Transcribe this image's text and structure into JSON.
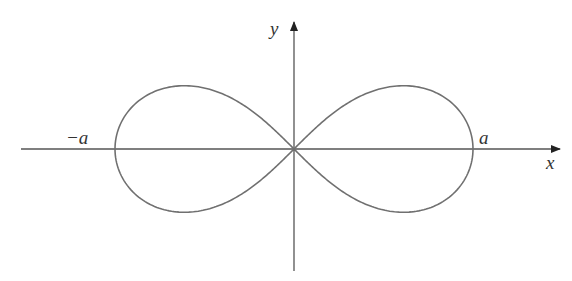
{
  "diagram": {
    "title": "",
    "curve": {
      "name": "lemniscate",
      "color": "#707070",
      "parameter_label": "a"
    },
    "axes": {
      "color": "#555555",
      "x_label": "x",
      "y_label": "y"
    },
    "labels": {
      "neg_a": "−a",
      "pos_a": "a",
      "x": "x",
      "y": "y"
    }
  }
}
